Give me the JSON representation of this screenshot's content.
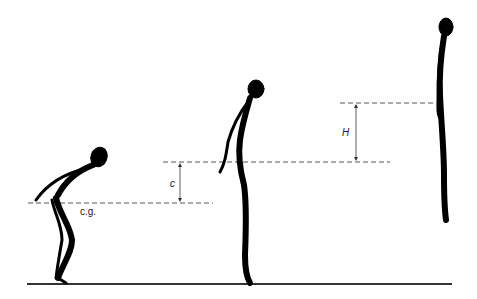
{
  "diagram": {
    "type": "vertical-jump-phases",
    "phases": [
      "crouch",
      "take-off",
      "flight-peak"
    ],
    "labels": {
      "center_of_gravity": "c.g.",
      "crouch_to_takeoff_height": "c",
      "jump_height": "H"
    },
    "colors": {
      "figure": "#000000",
      "ground": "#333333",
      "dashed": "#555555",
      "background": "#ffffff"
    }
  }
}
